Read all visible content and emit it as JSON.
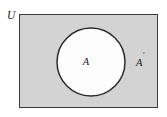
{
  "figure": {
    "type": "venn-diagram",
    "topic": "set-complement",
    "background_color": "#ffffff",
    "width": 167,
    "height": 117
  },
  "universe": {
    "label": "U",
    "fill_color": "#d3d3d3",
    "stroke_color": "#3a3a3a",
    "stroke_width": 1,
    "x": 19,
    "y": 14,
    "width": 139,
    "height": 94,
    "label_x": 7,
    "label_y": 16
  },
  "set_a": {
    "label": "A",
    "fill_color": "#fdfdfd",
    "stroke_color": "#2b2b2b",
    "stroke_width": 1.5,
    "center_x": 91,
    "center_y": 62,
    "radius": 34,
    "label_x": 86,
    "label_y": 63
  },
  "set_a_complement": {
    "label": "A",
    "prime": "′",
    "full_label": "A′",
    "region_description": "shaded area inside U outside A",
    "label_x": 136,
    "label_y": 64
  }
}
